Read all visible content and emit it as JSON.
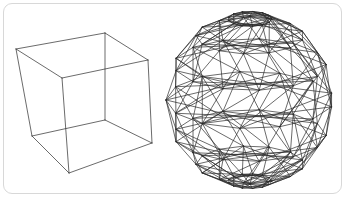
{
  "canvas": {
    "width": 345,
    "height": 197,
    "background_color": "#ffffff"
  },
  "card": {
    "name": "figure-card",
    "background_color": "#ffffff",
    "border_color": "#d8d8d8",
    "border_radius": 9,
    "x": 3,
    "y": 3,
    "width": 339,
    "height": 191
  },
  "style": {
    "stroke_color": "#2b2b2b",
    "stroke_width": 0.7,
    "fill": "none",
    "rendering": "wireframe-line-drawing"
  },
  "figures": [
    {
      "id": "cube",
      "label": "Wireframe cube",
      "type": "polyhedron-wireframe",
      "shape": "cube",
      "vertex_count": 8,
      "edge_count": 12,
      "hidden_lines_shown": true,
      "bounds": {
        "x": 16,
        "y": 30,
        "width": 140,
        "height": 145
      },
      "vertices": {
        "back_top_left": [
          16,
          49
        ],
        "back_top_right": [
          105,
          33
        ],
        "front_top_right": [
          148,
          60
        ],
        "front_top_left": [
          62,
          78
        ],
        "back_bottom_left": [
          32,
          136
        ],
        "back_bottom_right": [
          105,
          120
        ],
        "front_bottom_right": [
          152,
          143
        ],
        "front_bottom_left": [
          69,
          173
        ]
      },
      "edges": [
        [
          "back_top_left",
          "back_top_right"
        ],
        [
          "back_top_right",
          "front_top_right"
        ],
        [
          "front_top_right",
          "front_top_left"
        ],
        [
          "front_top_left",
          "back_top_left"
        ],
        [
          "back_bottom_left",
          "back_bottom_right"
        ],
        [
          "back_bottom_right",
          "front_bottom_right"
        ],
        [
          "front_bottom_right",
          "front_bottom_left"
        ],
        [
          "front_bottom_left",
          "back_bottom_left"
        ],
        [
          "back_top_left",
          "back_bottom_left"
        ],
        [
          "back_top_right",
          "back_bottom_right"
        ],
        [
          "front_top_right",
          "front_bottom_right"
        ],
        [
          "front_top_left",
          "front_bottom_left"
        ]
      ]
    },
    {
      "id": "geodesic-sphere",
      "label": "Wireframe geodesic polyhedron sphere",
      "type": "polyhedron-wireframe",
      "shape": "geodesic-sphere",
      "center": [
        250,
        100
      ],
      "radius": 84,
      "latitude_rings": 7,
      "longitude_segments": 13,
      "bracing": "alternating-diagonal-triangulation",
      "bounds": {
        "x": 166,
        "y": 12,
        "width": 168,
        "height": 176
      },
      "ring_latitudes_deg": [
        75,
        50,
        25,
        0,
        -25,
        -50,
        -75
      ]
    }
  ]
}
